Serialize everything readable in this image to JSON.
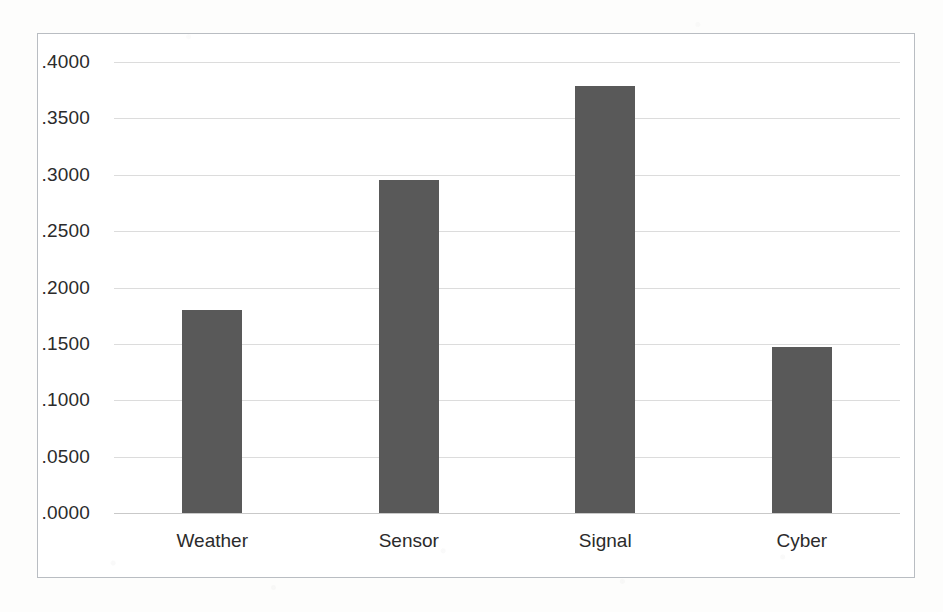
{
  "chart_data": {
    "type": "bar",
    "title": "",
    "subtitle": "",
    "xlabel": "",
    "ylabel": "",
    "categories": [
      "Weather",
      "Sensor",
      "Signal",
      "Cyber"
    ],
    "values": [
      0.18,
      0.2955,
      0.379,
      0.1475
    ],
    "ylim": [
      0.0,
      0.4
    ],
    "ytick_labels": [
      ".4000",
      ".3500",
      ".3000",
      ".2500",
      ".2000",
      ".1500",
      ".1000",
      ".0500",
      ".0000"
    ],
    "ytick_values": [
      0.4,
      0.35,
      0.3,
      0.25,
      0.2,
      0.15,
      0.1,
      0.05,
      0.0
    ],
    "grid": true,
    "legend": null,
    "legend_position": "none",
    "annotations": [],
    "colors": {
      "bar_fill": "#595959",
      "gridline": "#dcdcdc",
      "axis_line": "#c9c9c9",
      "frame_border": "#b9bdc2",
      "plot_background": "#ffffff",
      "page_background": "#fdfdfc",
      "tick_label_text": "#2b2b2b"
    }
  }
}
